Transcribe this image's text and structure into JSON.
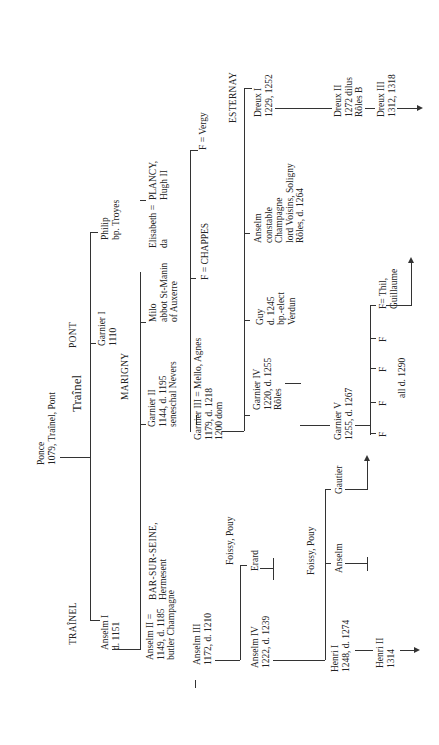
{
  "title": "Traînel",
  "root": {
    "name": "Ponce",
    "detail": "1079, Traînel, Pont"
  },
  "branches": {
    "trainel": "TRAÎNEL",
    "pont": "PONT",
    "marigny": "MARIGNY",
    "bar_sur_seine": "BAR-SUR-SEINE,",
    "esternay": "ESTERNAY",
    "foissy_pouy_1": "Foissy, Pouy",
    "foissy_pouy_2": "Foissy, Pouy"
  },
  "persons": {
    "anselm_1": {
      "l1": "Anselm I",
      "l2": "d. 1151"
    },
    "anselm_2": {
      "l1": "Anselm II =",
      "l2": "1149, d. 1185",
      "l3": "butler Champagne"
    },
    "hermesent": {
      "l1": "Hermesent"
    },
    "anselm_3": {
      "l1": "Anselm III",
      "l2": "1172, d. 1210"
    },
    "anselm_4": {
      "l1": "Anselm IV",
      "l2": "1222, d. 1239"
    },
    "erard": {
      "l1": "Erard"
    },
    "henri_1": {
      "l1": "Henri I",
      "l2": "1248, d. 1274"
    },
    "henri_2": {
      "l1": "Henri II",
      "l2": "1314"
    },
    "anselm_foissy": {
      "l1": "Anselm"
    },
    "gautier": {
      "l1": "Gautier"
    },
    "garnier_1": {
      "l1": "Garnier I",
      "l2": "1110"
    },
    "philip": {
      "l1": "Philip",
      "l2": "bp. Troyes"
    },
    "garnier_2": {
      "l1": "Garnier II",
      "l2": "1144, d. 1195",
      "l3": "seneschal Nevers"
    },
    "milo": {
      "l1": "Milo",
      "l2": "abbot St-Manin",
      "l3": "of Auxerre"
    },
    "elisabeth": {
      "l1": "Elisabeth =",
      "l2": "da"
    },
    "plancy": {
      "l1": "PLANCY,",
      "l2": "Hugh II"
    },
    "garnier_3": {
      "l1": "Garnier III = Mello, Agnes",
      "l2": "1179, d. 1218",
      "l3": "1200 dom"
    },
    "chappes": {
      "l1": "F = CHAPPES"
    },
    "vergy": {
      "l1": "F = Vergy"
    },
    "garnier_4": {
      "l1": "Garnier IV",
      "l2": "1220, d. 1255",
      "l3": "Rôles"
    },
    "guy": {
      "l1": "Guy",
      "l2": "d. 1245",
      "l3": "bp.-elect",
      "l4": "Verdun"
    },
    "anselm_constable": {
      "l1": "Anselm",
      "l2": "constable",
      "l3": "Champagne",
      "l4": "lord Voisins, Soligny",
      "l5": "Rôles, d. 1264"
    },
    "dreux_1": {
      "l1": "Dreux I",
      "l2": "1229, 1252"
    },
    "dreux_2": {
      "l1": "Dreux II",
      "l2": "1272 dilus",
      "l3": "Rôles B"
    },
    "dreux_3": {
      "l1": "Dreux III",
      "l2": "1312, 1318"
    },
    "garnier_5": {
      "l1": "Garnier V",
      "l2": "1255, d. 1267"
    },
    "daughters": {
      "f1": "F",
      "f2": "F",
      "f3": "F",
      "f4": "F",
      "f5": "F= Thil,",
      "f5b": "Guillaume",
      "note": "all d. 1290"
    }
  }
}
